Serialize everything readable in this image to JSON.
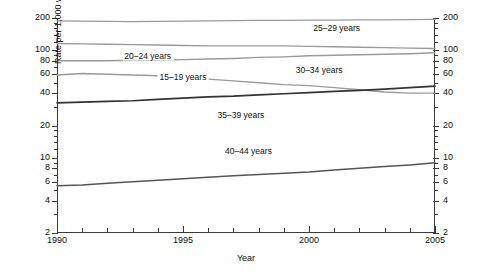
{
  "chart_data": {
    "type": "line",
    "title": "",
    "xlabel": "Year",
    "ylabel": "Rate per 1,000 women in specified age group",
    "yscale": "log",
    "ylim": [
      2,
      200
    ],
    "xlim": [
      1990,
      2005
    ],
    "grid": false,
    "legend": "inline-labels",
    "ytick_labels": [
      "200",
      "100",
      "80",
      "60",
      "40",
      "20",
      "10",
      "8",
      "6",
      "4",
      "2"
    ],
    "ytick_values": [
      200,
      100,
      80,
      60,
      40,
      20,
      10,
      8,
      6,
      4,
      2
    ],
    "yminor_values": [
      180,
      160,
      140,
      120,
      90,
      70,
      50,
      30,
      18,
      16,
      14,
      12,
      9,
      7,
      5,
      3
    ],
    "xtick_labels": [
      "1990",
      "1995",
      "2000",
      "2005"
    ],
    "xtick_values": [
      1990,
      1995,
      2000,
      2005
    ],
    "xminor_values": [
      1991,
      1992,
      1993,
      1994,
      1996,
      1997,
      1998,
      1999,
      2001,
      2002,
      2003,
      2004
    ],
    "x": [
      1990,
      1991,
      1992,
      1993,
      1994,
      1995,
      1996,
      1997,
      1998,
      1999,
      2000,
      2001,
      2002,
      2003,
      2004,
      2005
    ],
    "series": [
      {
        "name": "25-29 years",
        "label": "25–29 years",
        "color": "#9a9a9a",
        "width": 1.4,
        "label_x": 2001.1,
        "label_y": 160,
        "values": [
          188,
          187,
          186,
          185,
          186,
          187,
          188,
          189,
          190,
          190,
          191,
          191,
          192,
          192,
          193,
          194
        ]
      },
      {
        "name": "20-24 years",
        "label": "20–24 years",
        "color": "#9a9a9a",
        "width": 1.4,
        "label_x": 1993.6,
        "label_y": 88,
        "values": [
          116,
          115,
          114,
          113,
          112,
          111,
          110,
          110,
          110,
          110,
          109,
          108,
          107,
          106,
          105,
          104
        ]
      },
      {
        "name": "30-34 years",
        "label": "30–34 years",
        "color": "#9a9a9a",
        "width": 1.4,
        "label_x": 2000.4,
        "label_y": 66,
        "values": [
          80,
          80,
          80,
          81,
          81,
          82,
          83,
          84,
          86,
          87,
          89,
          90,
          91,
          92,
          93,
          95
        ]
      },
      {
        "name": "15-19 years",
        "label": "15–19 years",
        "color": "#9a9a9a",
        "width": 1.4,
        "label_x": 1995.0,
        "label_y": 56,
        "values": [
          59,
          61,
          60,
          59,
          58,
          56,
          54,
          52,
          50,
          48,
          47,
          45,
          43,
          41,
          40,
          40
        ]
      },
      {
        "name": "35-39 years",
        "label": "35–39 years",
        "color": "#333333",
        "width": 1.7,
        "label_x": 1997.3,
        "label_y": 25,
        "values": [
          32.5,
          33,
          33.5,
          34,
          35,
          36,
          37,
          37.5,
          38.5,
          39.5,
          40.5,
          41.5,
          42.5,
          43.5,
          45,
          46.5
        ]
      },
      {
        "name": "40-44 years",
        "label": "40–44 years",
        "color": "#555555",
        "width": 1.5,
        "label_x": 1997.6,
        "label_y": 11.5,
        "values": [
          5.5,
          5.6,
          5.8,
          6.0,
          6.2,
          6.4,
          6.6,
          6.8,
          7.0,
          7.2,
          7.4,
          7.7,
          8.0,
          8.3,
          8.6,
          9.0
        ]
      }
    ]
  }
}
